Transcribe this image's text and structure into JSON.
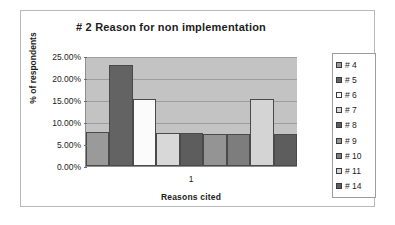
{
  "chart_data": {
    "type": "bar",
    "title": "# 2 Reason for non implementation",
    "xlabel": "Reasons cited",
    "ylabel": "% of respondents",
    "x_tick_labels": [
      "1"
    ],
    "categories": [
      "1"
    ],
    "ylim": [
      0,
      25
    ],
    "y_tick_labels": [
      "25.00%",
      "20.00%",
      "15.00%",
      "10.00%",
      "5.00%",
      "0.00%"
    ],
    "y_tick_values": [
      25,
      20,
      15,
      10,
      5,
      0
    ],
    "grid": true,
    "legend_position": "right",
    "plot_background": "#c3c3c3",
    "series": [
      {
        "name": "# 4",
        "values": [
          7.7
        ],
        "color": "#9a9a9a"
      },
      {
        "name": "# 5",
        "values": [
          23.0
        ],
        "color": "#636363"
      },
      {
        "name": "# 6",
        "values": [
          15.3
        ],
        "color": "#fbfbfb"
      },
      {
        "name": "# 7",
        "values": [
          7.4
        ],
        "color": "#d8d8d8"
      },
      {
        "name": "# 8",
        "values": [
          7.4
        ],
        "color": "#5d5d5d"
      },
      {
        "name": "# 9",
        "values": [
          7.3
        ],
        "color": "#949494"
      },
      {
        "name": "# 10",
        "values": [
          7.3
        ],
        "color": "#7d7d7d"
      },
      {
        "name": "# 11",
        "values": [
          15.2
        ],
        "color": "#d4d4d4"
      },
      {
        "name": "# 14",
        "values": [
          7.2
        ],
        "color": "#5d5d5d"
      }
    ]
  }
}
